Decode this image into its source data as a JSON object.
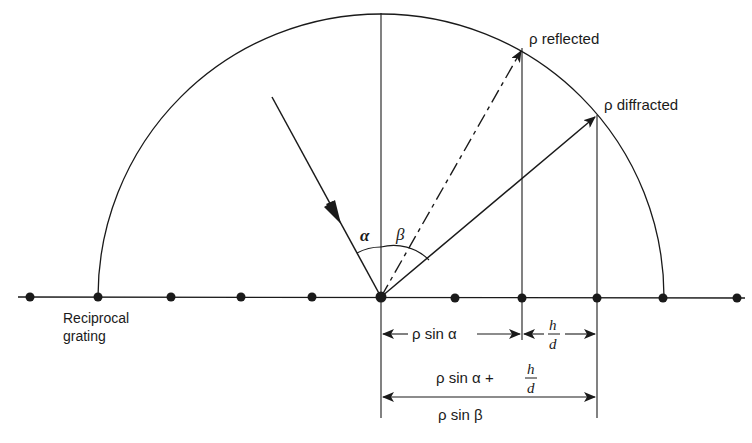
{
  "diagram": {
    "type": "Ewald construction for grating diffraction",
    "labels": {
      "reflected": "ρ reflected",
      "diffracted": "ρ diffracted",
      "grating_line1": "Reciprocal",
      "grating_line2": "grating",
      "alpha": "α",
      "beta": "β",
      "rho_sin_alpha": "ρ sin α",
      "h_over_d_num": "h",
      "h_over_d_den": "d",
      "sum_expr": "ρ sin α +",
      "sum_num": "h",
      "sum_den": "d",
      "rho_sin_beta": "ρ sin β"
    },
    "colors": {
      "ink": "#1a1a1a",
      "background": "#ffffff"
    },
    "grating_points_x": [
      30,
      98,
      171,
      241,
      312,
      381,
      455,
      522,
      597,
      663,
      737
    ]
  }
}
